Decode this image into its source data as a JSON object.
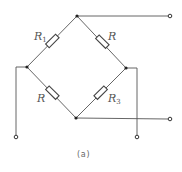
{
  "diagram": {
    "type": "wheatstone-bridge",
    "caption": "(a)",
    "resistors": [
      {
        "id": "top-left",
        "label": "R",
        "subscript": "1"
      },
      {
        "id": "top-right",
        "label": "R",
        "subscript": ""
      },
      {
        "id": "bottom-left",
        "label": "R",
        "subscript": ""
      },
      {
        "id": "bottom-right",
        "label": "R",
        "subscript": "3"
      }
    ],
    "colors": {
      "line": "#555555",
      "background": "#ffffff"
    }
  }
}
